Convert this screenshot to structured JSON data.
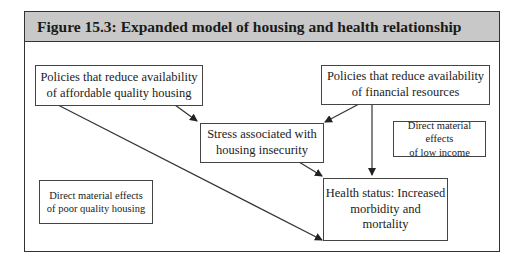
{
  "figure": {
    "title": "Figure 15.3: Expanded model of housing and health relationship",
    "colors": {
      "header_bg": "#c8c8c8",
      "border": "#333333",
      "text": "#222222"
    }
  },
  "nodes": {
    "policies_housing": {
      "line1": "Policies that reduce availability",
      "line2": "of affordable quality housing"
    },
    "policies_financial": {
      "line1": "Policies that reduce availability",
      "line2": "of financial resources"
    },
    "stress": {
      "line1": "Stress associated with",
      "line2": "housing insecurity"
    },
    "health_status": {
      "line1": "Health status: Increased",
      "line2": "morbidity and",
      "line3": "mortality"
    },
    "direct_low_income": {
      "line1": "Direct material effects",
      "line2": "of low income"
    },
    "direct_poor_housing": {
      "line1": "Direct material effects",
      "line2": "of poor quality housing"
    }
  },
  "edges": [
    {
      "from": "policies_housing",
      "to": "stress"
    },
    {
      "from": "policies_housing",
      "to": "health_status"
    },
    {
      "from": "policies_financial",
      "to": "stress"
    },
    {
      "from": "policies_financial",
      "to": "health_status"
    },
    {
      "from": "stress",
      "to": "health_status"
    }
  ]
}
